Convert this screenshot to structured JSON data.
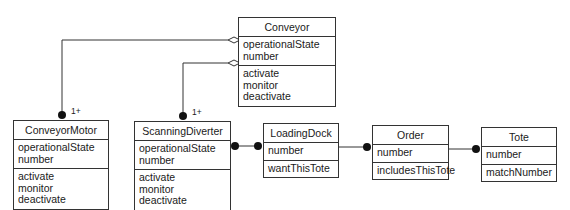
{
  "classes": {
    "conveyor": {
      "name": "Conveyor",
      "attributes": [
        "operationalState",
        "number"
      ],
      "operations": [
        "activate",
        "monitor",
        "deactivate"
      ]
    },
    "conveyorMotor": {
      "name": "ConveyorMotor",
      "attributes": [
        "operationalState",
        "number"
      ],
      "operations": [
        "activate",
        "monitor",
        "deactivate"
      ]
    },
    "scanningDiverter": {
      "name": "ScanningDiverter",
      "attributes": [
        "operationalState",
        "number"
      ],
      "operations": [
        "activate",
        "monitor",
        "deactivate"
      ]
    },
    "loadingDock": {
      "name": "LoadingDock",
      "attributes": [
        "number"
      ],
      "operations": [
        "wantThisTote"
      ]
    },
    "order": {
      "name": "Order",
      "attributes": [
        "number"
      ],
      "operations": [
        "includesThisTote"
      ]
    },
    "tote": {
      "name": "Tote",
      "attributes": [
        "number"
      ],
      "operations": [
        "matchNumber"
      ]
    }
  },
  "associations": {
    "conveyor_conveyorMotor": {
      "type": "aggregation",
      "multiplicity": "1+"
    },
    "conveyor_scanningDiverter": {
      "type": "aggregation",
      "multiplicity": "1+"
    },
    "scanningDiverter_loadingDock": {
      "type": "association"
    },
    "loadingDock_order": {
      "type": "association"
    },
    "order_tote": {
      "type": "association"
    }
  }
}
